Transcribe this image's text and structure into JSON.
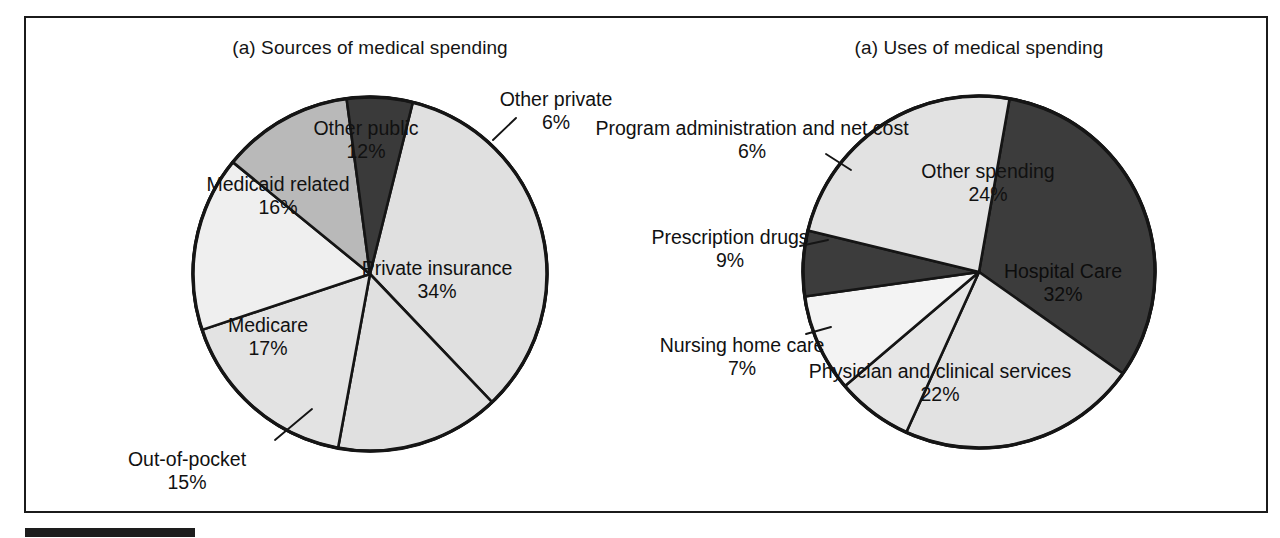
{
  "figure": {
    "background": "#ffffff",
    "frame_color": "#1b1b1b",
    "footer_rule_color": "#1d1d1d"
  },
  "panels": {
    "left": {
      "title": "(a) Sources of medical spending",
      "center": [
        370,
        274
      ],
      "radius": 177
    },
    "right": {
      "title": "(a) Uses of medical spending",
      "center": [
        979,
        272
      ],
      "radius": 176
    }
  },
  "chart_data": [
    {
      "type": "pie",
      "title": "(a) Sources of medical spending",
      "xlabel": "",
      "ylabel": "",
      "unit": "percent",
      "total": 100,
      "legend_position": "labels-on-slices",
      "grid": false,
      "categories": [
        "Private insurance",
        "Out-of-pocket",
        "Medicare",
        "Medicaid related",
        "Other public",
        "Other private"
      ],
      "values": [
        34,
        15,
        17,
        16,
        12,
        6
      ],
      "slices": [
        {
          "label": "Private insurance",
          "value": 34,
          "pct_text": "34%",
          "color": "#e0e0e0",
          "label_placement": "inside",
          "label_xy": [
            437,
            279
          ],
          "start_deg": 14,
          "end_deg": 136.4
        },
        {
          "label": "Out-of-pocket",
          "value": 15,
          "pct_text": "15%",
          "color": "#e0e0e0",
          "label_placement": "outside",
          "label_xy": [
            187,
            470
          ],
          "leader": [
            [
              275,
              440
            ],
            [
              312,
              409
            ]
          ],
          "start_deg": 136.4,
          "end_deg": 190.4
        },
        {
          "label": "Medicare",
          "value": 17,
          "pct_text": "17%",
          "color": "#e3e3e3",
          "label_placement": "inside",
          "label_xy": [
            268,
            336
          ],
          "start_deg": 190.4,
          "end_deg": 251.6
        },
        {
          "label": "Medicaid related",
          "value": 16,
          "pct_text": "16%",
          "color": "#efefef",
          "label_placement": "inside",
          "label_xy": [
            278,
            195
          ],
          "start_deg": 251.6,
          "end_deg": 309.2
        },
        {
          "label": "Other public",
          "value": 12,
          "pct_text": "12%",
          "color": "#b9b9b9",
          "label_placement": "inside",
          "label_xy": [
            366,
            139
          ],
          "start_deg": 309.2,
          "end_deg": 352.4
        },
        {
          "label": "Other private",
          "value": 6,
          "pct_text": "6%",
          "color": "#3a3a3a",
          "label_placement": "outside",
          "label_xy": [
            556,
            110
          ],
          "leader": [
            [
              493,
              140
            ],
            [
              516,
              118
            ]
          ],
          "start_deg": 352.4,
          "end_deg": 374
        }
      ]
    },
    {
      "type": "pie",
      "title": "(a) Uses of medical spending",
      "xlabel": "",
      "ylabel": "",
      "unit": "percent",
      "total": 100,
      "legend_position": "labels-on-slices",
      "grid": false,
      "categories": [
        "Hospital Care",
        "Physician and clinical services",
        "Nursing home care",
        "Prescription drugs",
        "Program administration and net cost",
        "Other spending"
      ],
      "values": [
        32,
        22,
        7,
        9,
        6,
        24
      ],
      "slices": [
        {
          "label": "Hospital Care",
          "value": 32,
          "pct_text": "32%",
          "color": "#3c3c3c",
          "label_placement": "inside",
          "label_xy": [
            1063,
            282
          ],
          "start_deg": 10,
          "end_deg": 125.2
        },
        {
          "label": "Physician and clinical services",
          "value": 22,
          "pct_text": "22%",
          "color": "#e2e2e2",
          "label_placement": "inside",
          "label_xy": [
            940,
            382
          ],
          "start_deg": 125.2,
          "end_deg": 204.4
        },
        {
          "label": "Nursing home care",
          "value": 7,
          "pct_text": "7%",
          "color": "#e6e6e6",
          "label_placement": "outside",
          "label_xy": [
            742,
            356
          ],
          "leader": [
            [
              806,
              334
            ],
            [
              831,
              327
            ]
          ],
          "start_deg": 204.4,
          "end_deg": 229.6
        },
        {
          "label": "Prescription drugs",
          "value": 9,
          "pct_text": "9%",
          "color": "#f3f3f3",
          "label_placement": "outside",
          "label_xy": [
            730,
            248
          ],
          "leader": [
            [
              800,
              246
            ],
            [
              828,
              240
            ]
          ],
          "start_deg": 229.6,
          "end_deg": 262
        },
        {
          "label": "Program administration and net cost",
          "value": 6,
          "pct_text": "6%",
          "color": "#3c3c3c",
          "label_placement": "outside",
          "label_xy": [
            752,
            139
          ],
          "leader": [
            [
              826,
              154
            ],
            [
              851,
              170
            ]
          ],
          "start_deg": 262,
          "end_deg": 283.6
        },
        {
          "label": "Other spending",
          "value": 24,
          "pct_text": "24%",
          "color": "#e2e2e2",
          "label_placement": "inside",
          "label_xy": [
            988,
            182
          ],
          "start_deg": 283.6,
          "end_deg": 370
        }
      ]
    }
  ]
}
